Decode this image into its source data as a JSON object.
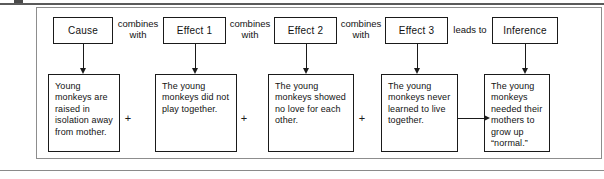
{
  "figure": {
    "type": "cause-effect-inference-flow-diagram",
    "top_row": [
      {
        "id": "cause",
        "label": "Cause",
        "x": 53,
        "width": 60
      },
      {
        "id": "effect-1",
        "label": "Effect 1",
        "x": 163,
        "width": 63
      },
      {
        "id": "effect-2",
        "label": "Effect 2",
        "x": 274,
        "width": 63
      },
      {
        "id": "effect-3",
        "label": "Effect 3",
        "x": 385,
        "width": 63
      },
      {
        "id": "inference",
        "label": "Inference",
        "x": 492,
        "width": 66
      }
    ],
    "connectors": [
      {
        "id": "connector-1",
        "line1": "combines",
        "line2": "with",
        "x": 113,
        "width": 50
      },
      {
        "id": "connector-2",
        "line1": "combines",
        "line2": "with",
        "x": 226,
        "width": 48
      },
      {
        "id": "connector-3",
        "line1": "combines",
        "line2": "with",
        "x": 337,
        "width": 48
      },
      {
        "id": "connector-4",
        "line1": "leads to",
        "line2": "",
        "x": 448,
        "width": 44
      }
    ],
    "bottom_row": [
      {
        "id": "detail-cause",
        "text": "Young monkeys are raised in isolation away from mother.",
        "x": 48,
        "width": 72
      },
      {
        "id": "detail-effect-1",
        "text": "The young monkeys did not play together.",
        "x": 155,
        "width": 82
      },
      {
        "id": "detail-effect-2",
        "text": "The young monkeys showed no love for each other.",
        "x": 268,
        "width": 86
      },
      {
        "id": "detail-effect-3",
        "text": "The young monkeys never learned to live together.",
        "x": 381,
        "width": 77
      },
      {
        "id": "detail-inference",
        "text": "The young monkeys needed their mothers to grow up “normal.”",
        "x": 484,
        "width": 66
      }
    ],
    "operators": [
      {
        "id": "plus-1",
        "symbol": "+",
        "x": 122
      },
      {
        "id": "plus-2",
        "symbol": "+",
        "x": 238
      },
      {
        "id": "plus-3",
        "symbol": "+",
        "x": 356
      }
    ],
    "arrows": {
      "vertical": [
        {
          "id": "arrow-cause-down",
          "x": 83
        },
        {
          "id": "arrow-effect-1-down",
          "x": 195
        },
        {
          "id": "arrow-effect-2-down",
          "x": 306
        },
        {
          "id": "arrow-effect-3-down",
          "x": 417
        },
        {
          "id": "arrow-inference-down",
          "x": 525
        }
      ],
      "horizontal": [
        {
          "id": "arrow-effect-3-to-inference"
        }
      ]
    },
    "colors": {
      "background": "#ffffff",
      "ink": "#1a1a1a",
      "frame": "#8d8d8d",
      "rule": "#6f6f6f"
    }
  }
}
